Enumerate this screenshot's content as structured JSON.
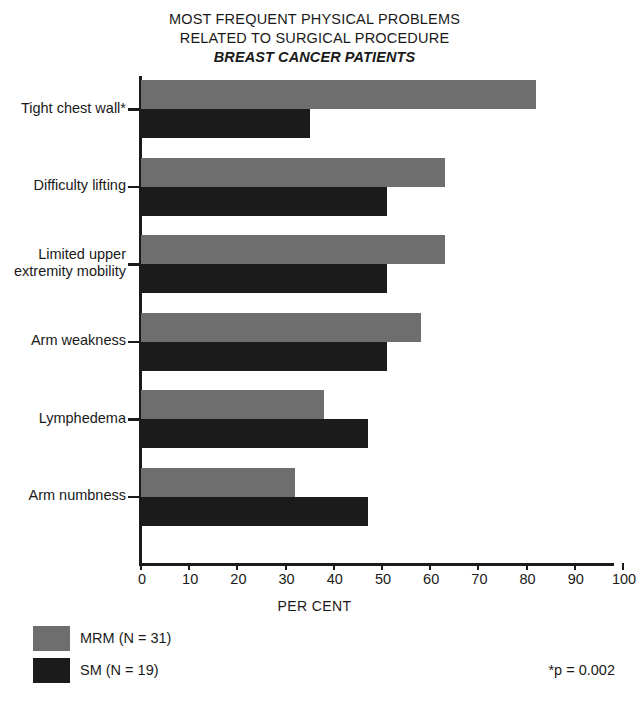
{
  "title": {
    "line1": "MOST FREQUENT PHYSICAL PROBLEMS",
    "line2": "RELATED TO SURGICAL PROCEDURE",
    "line3": "BREAST CANCER PATIENTS"
  },
  "xaxis_title": "PER CENT",
  "footnote": "*p = 0.002",
  "legend": [
    {
      "label": "MRM (N = 31)",
      "color": "#6e6e6e",
      "key": "MRM"
    },
    {
      "label": "SM (N = 19)",
      "color": "#1b1b1b",
      "key": "SM"
    }
  ],
  "chart_data": {
    "type": "bar",
    "orientation": "horizontal",
    "title": "MOST FREQUENT PHYSICAL PROBLEMS RELATED TO SURGICAL PROCEDURE BREAST CANCER PATIENTS",
    "subtitle": "BREAST CANCER PATIENTS",
    "xlabel": "PER CENT",
    "ylabel": "",
    "xlim": [
      0,
      100
    ],
    "xticks": [
      0,
      10,
      20,
      30,
      40,
      50,
      60,
      70,
      80,
      90,
      100
    ],
    "xticklabels": [
      "0",
      "10",
      "20",
      "30",
      "40",
      "50",
      "60",
      "70",
      "80",
      "90",
      "100"
    ],
    "grid": false,
    "legend_position": "bottom-left",
    "categories": [
      "Tight chest wall*",
      "Difficulty lifting",
      "Limited upper extremity mobility",
      "Arm weakness",
      "Lymphedema",
      "Arm numbness"
    ],
    "category_lines": [
      [
        "Tight chest wall*"
      ],
      [
        "Difficulty lifting"
      ],
      [
        "Limited upper",
        "extremity mobility"
      ],
      [
        "Arm weakness"
      ],
      [
        "Lymphedema"
      ],
      [
        "Arm numbness"
      ]
    ],
    "series": [
      {
        "name": "MRM (N = 31)",
        "color": "#6e6e6e",
        "values": [
          82,
          63,
          63,
          58,
          38,
          32
        ]
      },
      {
        "name": "SM (N = 19)",
        "color": "#1b1b1b",
        "values": [
          35,
          51,
          51,
          51,
          47,
          47
        ]
      }
    ],
    "annotations": [
      "*p = 0.002"
    ]
  }
}
